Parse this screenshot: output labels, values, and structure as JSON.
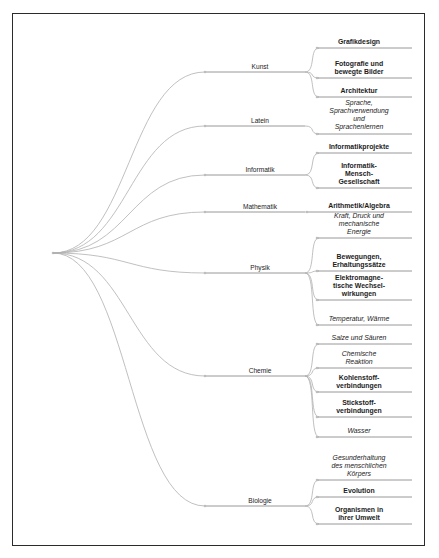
{
  "diagram": {
    "root_label": "",
    "frame_color": "#2b2b2b",
    "edge_color": "#b0b0b0",
    "underline_color": "#8d8d8d",
    "text_color": "#1c1c1c",
    "branches": [
      {
        "label": "Kunst",
        "children": [
          {
            "label": "Grafikdesign",
            "style": "bold"
          },
          {
            "label": "Fotografie und\nbewegte Bilder",
            "style": "bold"
          },
          {
            "label": "Architektur",
            "style": "bold"
          }
        ]
      },
      {
        "label": "Latein",
        "children": [
          {
            "label": "Sprache,\nSprachverwendung\nund\nSprachenlernen",
            "style": "italic"
          }
        ]
      },
      {
        "label": "Informatik",
        "children": [
          {
            "label": "Informatikprojekte",
            "style": "bold"
          },
          {
            "label": "Informatik-\nMensch-\nGesellschaft",
            "style": "bold"
          }
        ]
      },
      {
        "label": "Mathematik",
        "children": [
          {
            "label": "Arithmetik/Algebra",
            "style": "bold"
          }
        ]
      },
      {
        "label": "Physik",
        "children": [
          {
            "label": "Kraft, Druck und\nmechanische\nEnergie",
            "style": "italic"
          },
          {
            "label": "Bewegungen,\nErhaltungssätze",
            "style": "bold"
          },
          {
            "label": "Elektromagne-\ntische Wechsel-\nwirkungen",
            "style": "bold"
          },
          {
            "label": "Temperatur, Wärme",
            "style": "italic"
          }
        ]
      },
      {
        "label": "Chemie",
        "children": [
          {
            "label": "Salze und Säuren",
            "style": "italic"
          },
          {
            "label": "Chemische\nReaktion",
            "style": "italic"
          },
          {
            "label": "Kohlenstoff-\nverbindungen",
            "style": "bold"
          },
          {
            "label": "Stickstoff-\nverbindungen",
            "style": "bold"
          },
          {
            "label": "Wasser",
            "style": "italic"
          }
        ]
      },
      {
        "label": "Biologie",
        "children": [
          {
            "label": "Gesunderhaltung\ndes menschlichen\nKörpers",
            "style": "italic"
          },
          {
            "label": "Evolution",
            "style": "bold"
          },
          {
            "label": "Organismen in\nihrer Umwelt",
            "style": "bold"
          }
        ]
      }
    ]
  },
  "layout": {
    "root": {
      "x": 53,
      "y": 253
    },
    "parent_x_label": 260,
    "parent_line_x1": 205,
    "parent_line_x2": 305,
    "junction_x": 307,
    "leaf_x_center": 350,
    "leaf_line_x1": 307,
    "leaf_line_x2": 412,
    "parents_y": [
      72,
      126,
      175,
      212,
      273,
      376,
      506
    ],
    "leaves_y": [
      [
        48,
        78,
        97
      ],
      [
        134
      ],
      [
        153,
        188
      ],
      [
        212
      ],
      [
        238,
        271,
        300,
        325
      ],
      [
        344,
        368,
        392,
        417,
        437
      ],
      [
        480,
        497,
        524
      ]
    ]
  }
}
